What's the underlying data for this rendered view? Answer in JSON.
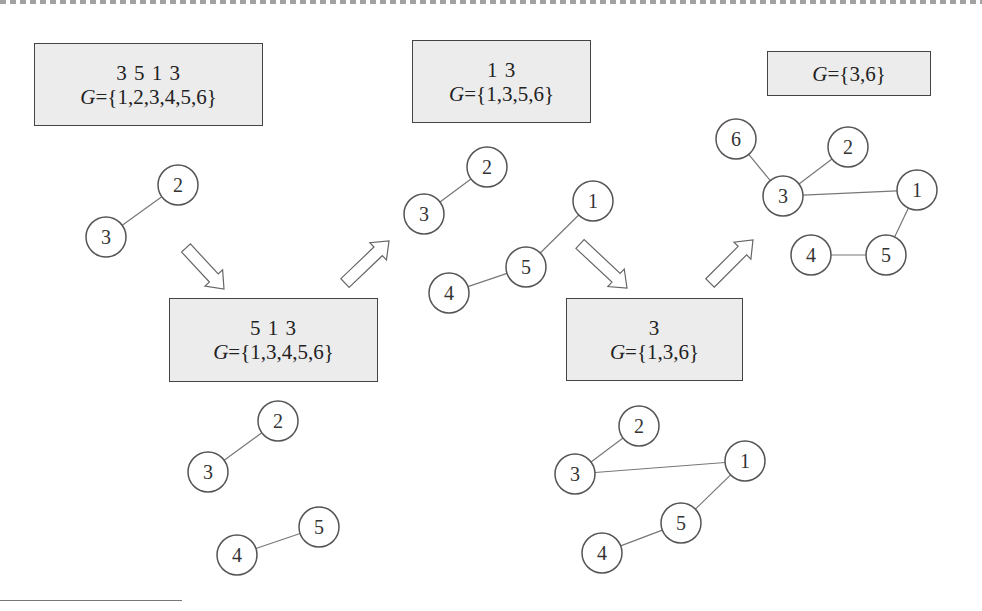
{
  "diagram": {
    "colors": {
      "box_fill": "#ececec",
      "box_border": "#444444",
      "node_stroke": "#555555",
      "edge": "#777777",
      "arrow": "#666666"
    },
    "boxes": [
      {
        "id": "box1",
        "sequence": "3 5 1 3",
        "set_var": "G",
        "set_value": "={1,2,3,4,5,6}",
        "x": 34,
        "y": 43,
        "w": 229,
        "h": 83
      },
      {
        "id": "box2",
        "sequence": "5 1 3",
        "set_var": "G",
        "set_value": "={1,3,4,5,6}",
        "x": 169,
        "y": 298,
        "w": 209,
        "h": 84
      },
      {
        "id": "box3",
        "sequence": "1 3",
        "set_var": "G",
        "set_value": "={1,3,5,6}",
        "x": 412,
        "y": 40,
        "w": 179,
        "h": 83
      },
      {
        "id": "box4",
        "sequence": "3",
        "set_var": "G",
        "set_value": "={1,3,6}",
        "x": 566,
        "y": 298,
        "w": 177,
        "h": 83
      },
      {
        "id": "box5",
        "sequence": "",
        "set_var": "G",
        "set_value": "={3,6}",
        "x": 767,
        "y": 51,
        "w": 164,
        "h": 45
      }
    ],
    "graphs": [
      {
        "id": "graph1",
        "nodes": [
          {
            "label": "2",
            "x": 178,
            "y": 185
          },
          {
            "label": "3",
            "x": 106,
            "y": 237
          }
        ],
        "edges": [
          [
            "2",
            "3"
          ]
        ]
      },
      {
        "id": "graph2",
        "nodes": [
          {
            "label": "2",
            "x": 278,
            "y": 421
          },
          {
            "label": "3",
            "x": 208,
            "y": 472
          },
          {
            "label": "4",
            "x": 237,
            "y": 555
          },
          {
            "label": "5",
            "x": 319,
            "y": 527
          }
        ],
        "edges": [
          [
            "2",
            "3"
          ],
          [
            "4",
            "5"
          ]
        ]
      },
      {
        "id": "graph3",
        "nodes": [
          {
            "label": "2",
            "x": 487,
            "y": 167
          },
          {
            "label": "3",
            "x": 424,
            "y": 214
          },
          {
            "label": "1",
            "x": 593,
            "y": 201
          },
          {
            "label": "5",
            "x": 526,
            "y": 267
          },
          {
            "label": "4",
            "x": 449,
            "y": 293
          }
        ],
        "edges": [
          [
            "2",
            "3"
          ],
          [
            "1",
            "5"
          ],
          [
            "5",
            "4"
          ]
        ]
      },
      {
        "id": "graph4",
        "nodes": [
          {
            "label": "2",
            "x": 639,
            "y": 426
          },
          {
            "label": "3",
            "x": 575,
            "y": 474
          },
          {
            "label": "1",
            "x": 745,
            "y": 461
          },
          {
            "label": "5",
            "x": 681,
            "y": 523
          },
          {
            "label": "4",
            "x": 602,
            "y": 553
          }
        ],
        "edges": [
          [
            "2",
            "3"
          ],
          [
            "3",
            "1"
          ],
          [
            "1",
            "5"
          ],
          [
            "5",
            "4"
          ]
        ]
      },
      {
        "id": "graph5",
        "nodes": [
          {
            "label": "6",
            "x": 736,
            "y": 139
          },
          {
            "label": "2",
            "x": 848,
            "y": 147
          },
          {
            "label": "3",
            "x": 783,
            "y": 196
          },
          {
            "label": "1",
            "x": 917,
            "y": 190
          },
          {
            "label": "4",
            "x": 811,
            "y": 255
          },
          {
            "label": "5",
            "x": 886,
            "y": 255
          }
        ],
        "edges": [
          [
            "6",
            "3"
          ],
          [
            "2",
            "3"
          ],
          [
            "3",
            "1"
          ],
          [
            "1",
            "5"
          ],
          [
            "4",
            "5"
          ]
        ]
      }
    ],
    "arrows": [
      {
        "id": "arrow-down-1",
        "direction": "down-right",
        "x1": 186,
        "y1": 248,
        "x2": 224,
        "y2": 289
      },
      {
        "id": "arrow-up-1",
        "direction": "up-right",
        "x1": 345,
        "y1": 283,
        "x2": 389,
        "y2": 241
      },
      {
        "id": "arrow-down-2",
        "direction": "down-right",
        "x1": 580,
        "y1": 244,
        "x2": 627,
        "y2": 288
      },
      {
        "id": "arrow-up-2",
        "direction": "up-right",
        "x1": 710,
        "y1": 283,
        "x2": 753,
        "y2": 240
      }
    ],
    "node_radius": 20
  }
}
